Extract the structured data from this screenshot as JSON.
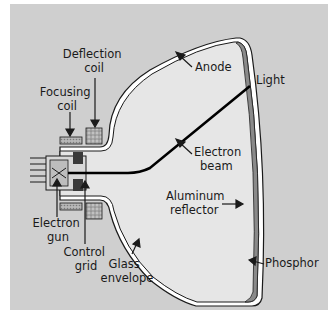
{
  "diagram": {
    "labels": {
      "deflection_coil": [
        "Deflection",
        "coil"
      ],
      "focusing_coil": [
        "Focusing",
        "coil"
      ],
      "anode": "Anode",
      "light": "Light",
      "electron_beam": [
        "Electron",
        "beam"
      ],
      "aluminum_reflector": [
        "Aluminum",
        "reflector"
      ],
      "phosphor": "Phosphor",
      "electron_gun": [
        "Electron",
        "gun"
      ],
      "control_grid": [
        "Control",
        "grid"
      ],
      "glass_envelope": [
        "Glass",
        "envelope"
      ]
    },
    "colors": {
      "background": "#cfcfcf",
      "tube_interior": "#e6e6e6",
      "glass": "#ffffff",
      "outline": "#1a1a1a",
      "phosphor": "#8a8a8a",
      "beam": "#000000"
    }
  }
}
